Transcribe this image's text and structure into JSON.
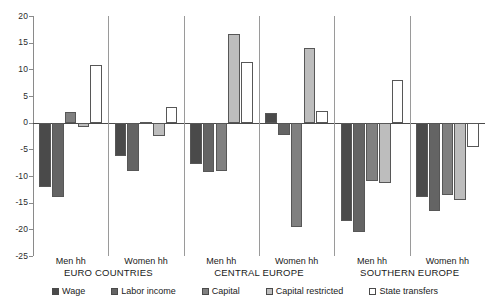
{
  "chart_data": {
    "type": "bar",
    "title": "",
    "subtitle": "",
    "xlabel": "",
    "ylabel": "",
    "ylim": [
      -25,
      20
    ],
    "yticks": [
      20,
      15,
      10,
      5,
      0,
      -5,
      -10,
      -15,
      -20,
      -25
    ],
    "ytick_labels": [
      "20",
      "15",
      "10",
      "5",
      "0",
      "-5",
      "-10",
      "-15",
      "-20",
      "-25"
    ],
    "grid": false,
    "legend_position": "bottom",
    "zero_reference_line": true,
    "categories": [
      "Men hh",
      "Women hh",
      "Men hh",
      "Women hh",
      "Men hh",
      "Women hh"
    ],
    "category_groups": [
      {
        "label": "EURO COUNTRIES",
        "categories": [
          "Men hh",
          "Women hh"
        ]
      },
      {
        "label": "CENTRAL EUROPE",
        "categories": [
          "Men hh",
          "Women hh"
        ]
      },
      {
        "label": "SOUTHERN EUROPE",
        "categories": [
          "Men hh",
          "Women hh"
        ]
      }
    ],
    "series": [
      {
        "name": "Wage",
        "color": "#4a4a4a",
        "values": [
          -12.0,
          -6.2,
          -7.8,
          1.8,
          -18.5,
          -14.0
        ]
      },
      {
        "name": "Labor income",
        "color": "#646464",
        "values": [
          -14.0,
          -9.0,
          -9.2,
          -2.3,
          -20.5,
          -16.5
        ]
      },
      {
        "name": "Capital",
        "color": "#808080",
        "values": [
          2.0,
          0.2,
          -9.0,
          -19.5,
          -11.0,
          -13.5
        ]
      },
      {
        "name": "Capital restricted",
        "color": "#bdbdbd",
        "values": [
          -0.8,
          -2.5,
          16.7,
          14.0,
          -11.3,
          -14.5
        ]
      },
      {
        "name": "State transfers",
        "color": "#ffffff",
        "values": [
          10.8,
          3.0,
          11.3,
          2.2,
          8.0,
          -4.5
        ]
      }
    ]
  },
  "legend": {
    "items": [
      {
        "label": "Wage",
        "color": "#4a4a4a"
      },
      {
        "label": "Labor income",
        "color": "#646464"
      },
      {
        "label": "Capital",
        "color": "#808080"
      },
      {
        "label": "Capital restricted",
        "color": "#bdbdbd"
      },
      {
        "label": "State transfers",
        "color": "#ffffff"
      }
    ]
  }
}
